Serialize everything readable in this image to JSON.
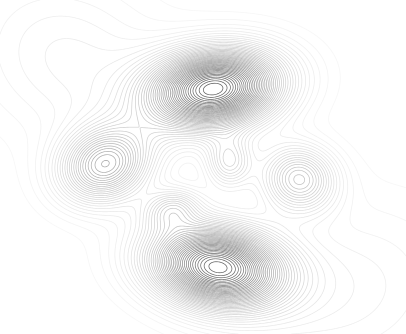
{
  "figure": {
    "title": "",
    "subtitle": "",
    "width": 406,
    "height": 334,
    "background_color": "#ffffff",
    "has_axes": false,
    "has_axis_labels": false,
    "has_tick_labels": false,
    "has_legend": false,
    "has_colorbar": false,
    "has_border": false,
    "description": "Unlabeled line contour plot of a smooth two-dimensional scalar field showing six closed extrema separated by saddle regions"
  },
  "chart_data": {
    "type": "line",
    "plot_kind": "contour",
    "title": "",
    "subtitle": "",
    "xlabel": "",
    "ylabel": "",
    "xlim": [
      0,
      406
    ],
    "ylim": [
      0,
      334
    ],
    "grid": false,
    "legend_position": "none",
    "tick_labels_x": [],
    "tick_labels_y": [],
    "annotations": [],
    "line_color_min": "#f2f2f2",
    "line_color_max": "#4a4a4a",
    "line_width": 0.7,
    "contour_levels": 46,
    "level_min": 0.0,
    "level_max": 1.0,
    "level_step": 0.022,
    "field_model": "sum-of-anisotropic-gaussians",
    "grid_samples_x": 406,
    "grid_samples_y": 334,
    "extrema": [
      {
        "name": "north-peak",
        "kind": "maximum",
        "x": 214,
        "y": 89,
        "amplitude": 1.0,
        "sigma_x": 46,
        "sigma_y": 27,
        "rotation_deg": -8,
        "closed_rings": 20,
        "darkness": 0.95
      },
      {
        "name": "south-peak",
        "kind": "maximum",
        "x": 217,
        "y": 267,
        "amplitude": 0.97,
        "sigma_x": 47,
        "sigma_y": 28,
        "rotation_deg": 9,
        "closed_rings": 20,
        "darkness": 0.92
      },
      {
        "name": "west-peak",
        "kind": "maximum",
        "x": 105,
        "y": 165,
        "amplitude": 0.54,
        "sigma_x": 33,
        "sigma_y": 26,
        "rotation_deg": -18,
        "closed_rings": 9,
        "darkness": 0.48
      },
      {
        "name": "east-peak",
        "kind": "maximum",
        "x": 299,
        "y": 179,
        "amplitude": 0.4,
        "sigma_x": 26,
        "sigma_y": 23,
        "rotation_deg": 12,
        "closed_rings": 6,
        "darkness": 0.3
      },
      {
        "name": "central-upper-lobe",
        "kind": "maximum",
        "x": 229,
        "y": 162,
        "amplitude": 0.27,
        "sigma_x": 16,
        "sigma_y": 18,
        "rotation_deg": 0,
        "closed_rings": 3,
        "darkness": 0.18
      },
      {
        "name": "central-lower-lobe",
        "kind": "maximum",
        "x": 172,
        "y": 209,
        "amplitude": 0.25,
        "sigma_x": 20,
        "sigma_y": 14,
        "rotation_deg": -14,
        "closed_rings": 3,
        "darkness": 0.16
      },
      {
        "name": "outer-halo-north-west",
        "kind": "shoulder",
        "x": 70,
        "y": 60,
        "amplitude": 0.12,
        "sigma_x": 70,
        "sigma_y": 55,
        "rotation_deg": 25,
        "closed_rings": 0,
        "darkness": 0.08
      },
      {
        "name": "outer-halo-south-east",
        "kind": "shoulder",
        "x": 350,
        "y": 290,
        "amplitude": 0.1,
        "sigma_x": 75,
        "sigma_y": 60,
        "rotation_deg": -20,
        "closed_rings": 0,
        "darkness": 0.07
      }
    ],
    "series": [
      {
        "name": "contour-levels",
        "values": [
          0.0,
          0.022,
          0.044,
          0.067,
          0.089,
          0.111,
          0.133,
          0.156,
          0.178,
          0.2,
          0.222,
          0.244,
          0.267,
          0.289,
          0.311,
          0.333,
          0.356,
          0.378,
          0.4,
          0.422,
          0.444,
          0.467,
          0.489,
          0.511,
          0.533,
          0.556,
          0.578,
          0.6,
          0.622,
          0.644,
          0.667,
          0.689,
          0.711,
          0.733,
          0.756,
          0.778,
          0.8,
          0.822,
          0.844,
          0.867,
          0.889,
          0.911,
          0.933,
          0.956,
          0.978,
          1.0
        ]
      }
    ]
  }
}
